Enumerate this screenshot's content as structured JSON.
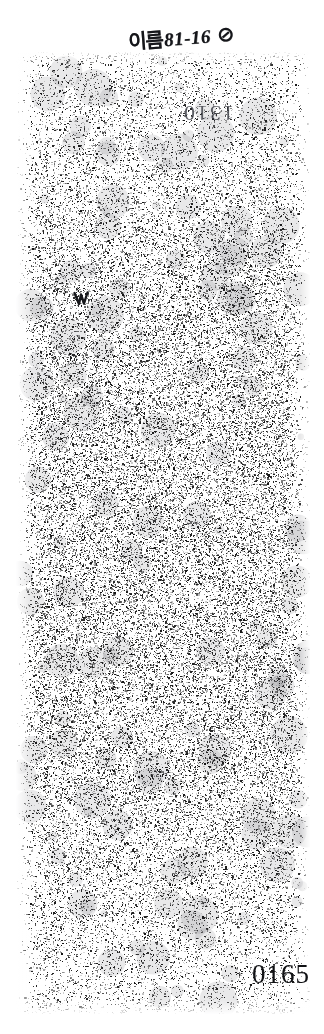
{
  "page": {
    "width": 324,
    "height": 1034,
    "background_color": "#ffffff",
    "ink_color": "#15161a"
  },
  "annotations": {
    "handwritten_note": {
      "name_label": "이름",
      "code": "81-16",
      "mark_glyph": "⊘"
    },
    "bleedthrough": {
      "text": "1310",
      "note": "show-through digits from reverse side, appears upside-down"
    },
    "margin_mark": {
      "icon": "hand-drawn-tick-mark"
    }
  },
  "stamps": {
    "page_number": "0165"
  }
}
